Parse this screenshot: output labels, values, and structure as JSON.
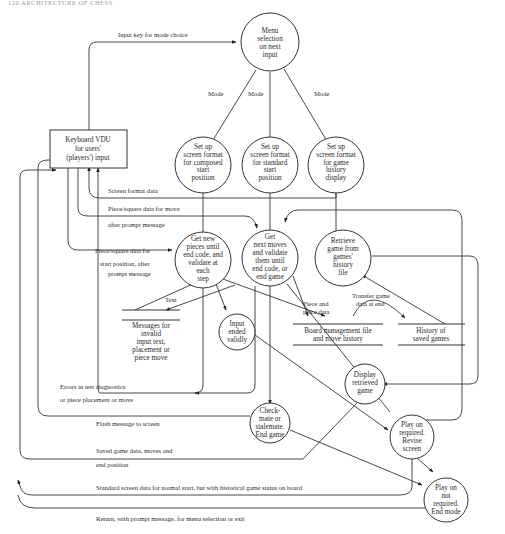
{
  "header": {
    "text": "120   ARCHITECTURE OF CHESS"
  },
  "nodes": {
    "menu": [
      "Menu",
      "selection",
      "on next",
      "input"
    ],
    "keyboard": [
      "Keyboard VDU",
      "for users'",
      "(players') input"
    ],
    "setup_composed": [
      "Set up",
      "screen format",
      "for composed",
      "start",
      "position"
    ],
    "setup_standard": [
      "Set up",
      "screen format",
      "for standard",
      "start",
      "position"
    ],
    "setup_history": [
      "Set up",
      "screen format",
      "for game",
      "history",
      "display"
    ],
    "get_pieces": [
      "Get new",
      "pieces until",
      "end code, and",
      "validate at",
      "each",
      "step"
    ],
    "get_moves": [
      "Get",
      "next moves",
      "and validate",
      "them until",
      "end code, or",
      "end game"
    ],
    "retrieve": [
      "Retrieve",
      "game from",
      "games'",
      "history",
      "file"
    ],
    "input_ended": [
      "Input",
      "ended",
      "validly"
    ],
    "display_retrieved": [
      "Display",
      "retrieved",
      "game"
    ],
    "checkmate": [
      "Check-",
      "mate or",
      "stalemate.",
      "End game"
    ],
    "play_on_req": [
      "Play on",
      "required.",
      "Revise",
      "screen"
    ],
    "play_on_not": [
      "Play on",
      "not",
      "required.",
      "End mode"
    ]
  },
  "stores": {
    "messages": [
      "Messages for",
      "invalid",
      "input text,",
      "placement or",
      "piece move"
    ],
    "board": [
      "Board management file",
      "and move history"
    ],
    "history": [
      "History of",
      "saved games"
    ]
  },
  "flows": {
    "input_key": "Input key for mode choice",
    "mode1": "Mode",
    "mode2": "Mode",
    "mode3": "Mode",
    "screen_format": "Screen format data",
    "piece_move_1": "Piece/square data for move",
    "piece_move_2": "after prompt message",
    "piece_start_1": "Piece/square data for",
    "piece_start_2": "start position, after",
    "piece_start_3": "prompt message",
    "text": "Text",
    "piece_place_1": "Piece and",
    "piece_place_2": "place data",
    "transfer_1": "Transfer game",
    "transfer_2": "data at end",
    "errors_1": "Errors in test diagnostics",
    "errors_2": "or piece placement or move",
    "flash": "Flash message to screen",
    "saved_1": "Saved game data, moves and",
    "saved_2": "end position",
    "standard_screen": "Standard screen data for normal start, but with historical game status on board",
    "return": "Return, with prompt message, for menu selection or exit"
  }
}
